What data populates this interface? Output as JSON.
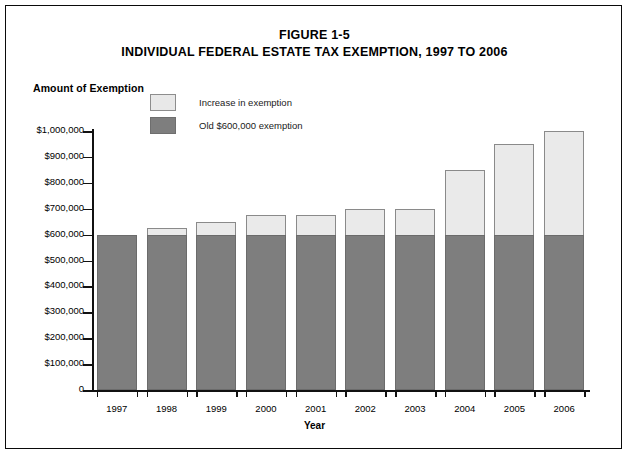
{
  "figure": {
    "number": "FIGURE 1-5",
    "title": "INDIVIDUAL FEDERAL ESTATE TAX EXEMPTION, 1997 TO 2006"
  },
  "axis_title_y": "Amount of Exemption",
  "axis_title_x": "Year",
  "legend": {
    "items": [
      {
        "label": "Increase in exemption",
        "swatch": "light-gray-swatch",
        "color": "#eaeaea"
      },
      {
        "label": "Old $600,000 exemption",
        "swatch": "dark-gray-swatch",
        "color": "#7e7e7e"
      }
    ]
  },
  "chart_data": {
    "type": "bar",
    "title": "INDIVIDUAL FEDERAL ESTATE TAX EXEMPTION, 1997 TO 2006",
    "subtitle": "FIGURE 1-5",
    "xlabel": "Year",
    "ylabel": "Amount of Exemption",
    "stacked": true,
    "grid": false,
    "legend_position": "top-left-inside",
    "categories": [
      "1997",
      "1998",
      "1999",
      "2000",
      "2001",
      "2002",
      "2003",
      "2004",
      "2005",
      "2006"
    ],
    "series": [
      {
        "name": "Old $600,000 exemption",
        "color": "#7e7e7e",
        "values": [
          600000,
          600000,
          600000,
          600000,
          600000,
          600000,
          600000,
          600000,
          600000,
          600000
        ]
      },
      {
        "name": "Increase in exemption",
        "color": "#eaeaea",
        "values": [
          0,
          25000,
          50000,
          75000,
          75000,
          100000,
          100000,
          250000,
          350000,
          400000
        ]
      }
    ],
    "totals": [
      600000,
      625000,
      650000,
      675000,
      675000,
      700000,
      700000,
      850000,
      950000,
      1000000
    ],
    "ylim": [
      0,
      1000000
    ],
    "ytick_values": [
      0,
      100000,
      200000,
      300000,
      400000,
      500000,
      600000,
      700000,
      800000,
      900000,
      1000000
    ],
    "ytick_labels": [
      "0",
      "$100,000",
      "$200,000",
      "$300,000",
      "$400,000",
      "$500,000",
      "$600,000",
      "$700,000",
      "$800,000",
      "$900,000",
      "$1,000,000"
    ]
  }
}
